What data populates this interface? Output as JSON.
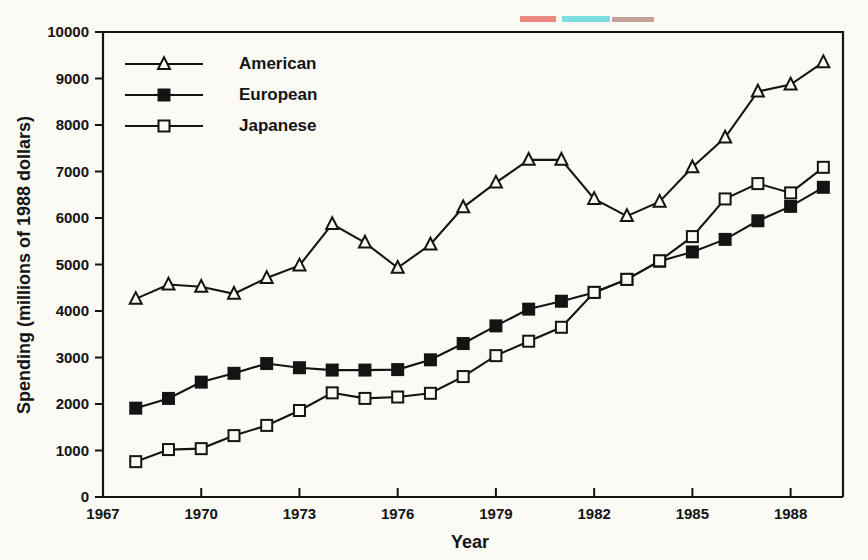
{
  "chart_data": {
    "type": "line",
    "title": "",
    "xlabel": "Year",
    "ylabel": "Spending (millions of 1988 dollars)",
    "xlim": [
      1967,
      1989.6
    ],
    "ylim": [
      0,
      10000
    ],
    "grid": false,
    "legend_position": "top-left inside plot",
    "x_ticks": [
      1967,
      1970,
      1973,
      1976,
      1979,
      1982,
      1985,
      1988
    ],
    "x_tick_labels": [
      "1967",
      "1970",
      "1973",
      "1976",
      "1979",
      "1982",
      "1985",
      "1988"
    ],
    "y_ticks": [
      0,
      1000,
      2000,
      3000,
      4000,
      5000,
      6000,
      7000,
      8000,
      9000,
      10000
    ],
    "y_tick_labels": [
      "0",
      "1000",
      "2000",
      "3000",
      "4000",
      "5000",
      "6000",
      "7000",
      "8000",
      "9000",
      "10000"
    ],
    "x": [
      1968,
      1969,
      1970,
      1971,
      1972,
      1973,
      1974,
      1975,
      1976,
      1977,
      1978,
      1979,
      1980,
      1981,
      1982,
      1983,
      1984,
      1985,
      1986,
      1987,
      1988,
      1989
    ],
    "series": [
      {
        "name": "American",
        "marker": "open-triangle",
        "values": [
          4260,
          4570,
          4520,
          4370,
          4710,
          4980,
          5870,
          5470,
          4930,
          5430,
          6230,
          6760,
          7250,
          7250,
          6410,
          6040,
          6350,
          7090,
          7730,
          8720,
          8870,
          9350
        ]
      },
      {
        "name": "European",
        "marker": "filled-square",
        "values": [
          1910,
          2120,
          2470,
          2660,
          2870,
          2780,
          2730,
          2730,
          2740,
          2950,
          3300,
          3680,
          4040,
          4210,
          4400,
          4680,
          5070,
          5270,
          5540,
          5940,
          6250,
          6660
        ]
      },
      {
        "name": "Japanese",
        "marker": "open-square",
        "values": [
          760,
          1020,
          1040,
          1320,
          1540,
          1860,
          2240,
          2120,
          2150,
          2230,
          2590,
          3040,
          3350,
          3650,
          4400,
          4680,
          5080,
          5600,
          6410,
          6740,
          6540,
          7090
        ]
      }
    ]
  },
  "legend": {
    "items": [
      {
        "label": "American",
        "marker": "open-triangle"
      },
      {
        "label": "European",
        "marker": "filled-square"
      },
      {
        "label": "Japanese",
        "marker": "open-square"
      }
    ]
  },
  "colors": {
    "ink": "#141414",
    "paper": "#fbfaf4"
  }
}
